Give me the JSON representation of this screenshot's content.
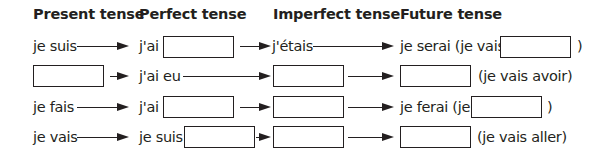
{
  "headers": {
    "present": "Present tense",
    "perfect": "Perfect tense",
    "imperfect": "Imperfect tense",
    "future": "Future tense"
  },
  "rows": [
    {
      "present": "je suis",
      "perfect_prefix": "j'ai",
      "imperfect": "j'étais",
      "future_prefix": "je serai (je vais",
      "future_suffix": ")"
    },
    {
      "perfect": "j'ai eu",
      "future_suffix": "(je vais avoir)"
    },
    {
      "present": "je fais",
      "perfect_prefix": "j'ai",
      "future_prefix": "je ferai (je",
      "future_suffix": ")"
    },
    {
      "present": "je vais",
      "perfect_prefix": "je suis",
      "future_suffix": "(je vais aller)"
    }
  ],
  "colors": {
    "ink": "#231f20",
    "background": "#ffffff"
  }
}
